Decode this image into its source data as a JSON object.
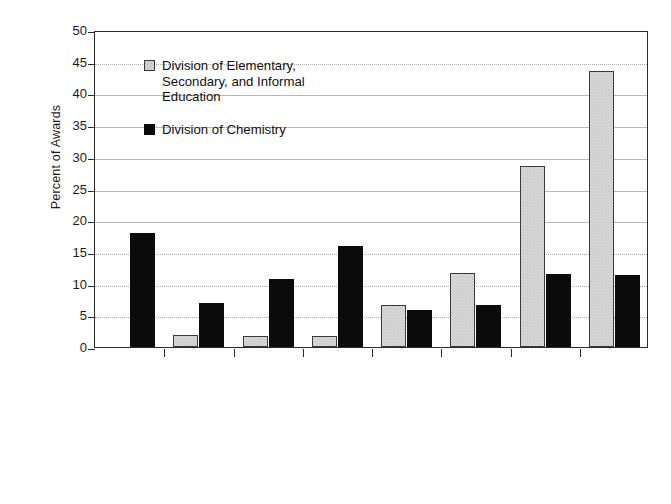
{
  "chart_data": {
    "type": "bar",
    "title": "",
    "xlabel": "",
    "ylabel": "Percent of Awards",
    "ylim": [
      0,
      50
    ],
    "ytick_step": 5,
    "grid": true,
    "legend_position": "upper-left-inside",
    "categories": [
      "Class\nVisits/Demos",
      "Research\nExperiences for\nTeachers",
      "Mentor/Tutor/Train",
      "Lab work for\nStudents",
      "Student Workshop",
      "Special\nActivities/Camps",
      "Curri./Mod.\nDevelopment",
      "Teacher\nWorkshop"
    ],
    "yticks": [
      "0",
      "5",
      "10",
      "15",
      "20",
      "25",
      "30",
      "35",
      "40",
      "45",
      "50"
    ],
    "series": [
      {
        "name": "Division of Elementary, Secondary, and Informal Education",
        "legend_label": "Division of Elementary,\nSecondary, and Informal\nEducation",
        "color": "#dcdcdc",
        "values": [
          0,
          1.9,
          1.8,
          1.8,
          6.7,
          11.7,
          28.6,
          43.5
        ]
      },
      {
        "name": "Division of Chemistry",
        "legend_label": "Division of Chemistry",
        "color": "#0b0b0b",
        "values": [
          18.0,
          6.9,
          10.7,
          15.9,
          5.8,
          6.6,
          11.5,
          11.4
        ]
      }
    ]
  }
}
